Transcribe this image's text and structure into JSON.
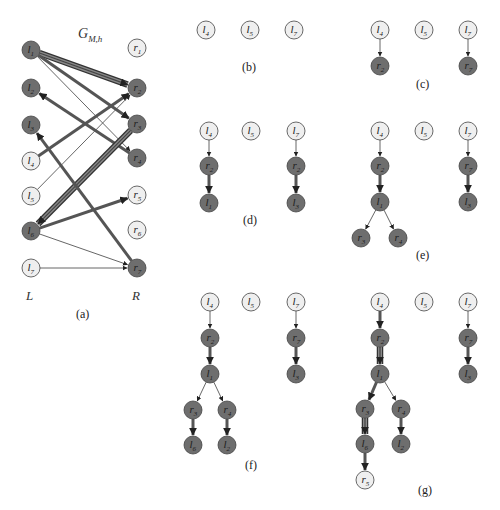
{
  "colors": {
    "matched_fill": "#6e6e6e",
    "free_fill": "#efefef",
    "stroke": "#444444",
    "edge": "#555555",
    "text_dark": "#222222"
  },
  "panel_a": {
    "title": "G",
    "title_sub": "M,h",
    "side_left": "L",
    "side_right": "R",
    "caption": "(a)",
    "left_nodes": [
      {
        "id": "l1",
        "name": "l",
        "sub": "1",
        "x": 31,
        "y": 50,
        "matched": true
      },
      {
        "id": "l2",
        "name": "l",
        "sub": "2",
        "x": 31,
        "y": 88,
        "matched": true
      },
      {
        "id": "l3",
        "name": "l",
        "sub": "3",
        "x": 31,
        "y": 125,
        "matched": true
      },
      {
        "id": "l4",
        "name": "l",
        "sub": "4",
        "x": 31,
        "y": 161,
        "matched": false
      },
      {
        "id": "l5",
        "name": "l",
        "sub": "5",
        "x": 31,
        "y": 196,
        "matched": false
      },
      {
        "id": "l6",
        "name": "l",
        "sub": "6",
        "x": 31,
        "y": 231,
        "matched": true
      },
      {
        "id": "l7",
        "name": "l",
        "sub": "7",
        "x": 31,
        "y": 268,
        "matched": false
      }
    ],
    "right_nodes": [
      {
        "id": "r1",
        "name": "r",
        "sub": "1",
        "x": 137,
        "y": 48,
        "matched": false
      },
      {
        "id": "r2",
        "name": "r",
        "sub": "2",
        "x": 137,
        "y": 88,
        "matched": true
      },
      {
        "id": "r3",
        "name": "r",
        "sub": "3",
        "x": 137,
        "y": 124,
        "matched": true
      },
      {
        "id": "r4",
        "name": "r",
        "sub": "4",
        "x": 137,
        "y": 158,
        "matched": true
      },
      {
        "id": "r5",
        "name": "r",
        "sub": "5",
        "x": 137,
        "y": 195,
        "matched": false
      },
      {
        "id": "r6",
        "name": "r",
        "sub": "6",
        "x": 137,
        "y": 230,
        "matched": false
      },
      {
        "id": "r7",
        "name": "r",
        "sub": "7",
        "x": 137,
        "y": 268,
        "matched": true
      }
    ],
    "edges": [
      {
        "from": "l1",
        "to": "r2",
        "weight": "thick"
      },
      {
        "from": "l1",
        "to": "r3",
        "weight": "medium"
      },
      {
        "from": "l1",
        "to": "r4",
        "weight": "thin"
      },
      {
        "from": "r4",
        "to": "l2",
        "weight": "medium"
      },
      {
        "from": "l4",
        "to": "r2",
        "weight": "medium"
      },
      {
        "from": "l5",
        "to": "r2",
        "weight": "thin"
      },
      {
        "from": "r3",
        "to": "l6",
        "weight": "thick"
      },
      {
        "from": "r7",
        "to": "l3",
        "weight": "medium"
      },
      {
        "from": "l6",
        "to": "r5",
        "weight": "medium"
      },
      {
        "from": "l6",
        "to": "r7",
        "weight": "thin"
      },
      {
        "from": "l7",
        "to": "r7",
        "weight": "thin"
      }
    ]
  },
  "panels": [
    {
      "id": "b",
      "caption": "(b)",
      "caption_x": 250,
      "caption_y": 71,
      "nodes": [
        {
          "id": "l4",
          "name": "l",
          "sub": "4",
          "x": 206,
          "y": 30,
          "matched": false
        },
        {
          "id": "l5",
          "name": "l",
          "sub": "5",
          "x": 250,
          "y": 30,
          "matched": false
        },
        {
          "id": "l7",
          "name": "l",
          "sub": "7",
          "x": 294,
          "y": 30,
          "matched": false
        }
      ],
      "edges": []
    },
    {
      "id": "c",
      "caption": "(c)",
      "caption_x": 424,
      "caption_y": 88,
      "nodes": [
        {
          "id": "l4",
          "name": "l",
          "sub": "4",
          "x": 380,
          "y": 30,
          "matched": false
        },
        {
          "id": "l5",
          "name": "l",
          "sub": "5",
          "x": 424,
          "y": 30,
          "matched": false
        },
        {
          "id": "l7",
          "name": "l",
          "sub": "7",
          "x": 468,
          "y": 30,
          "matched": false
        },
        {
          "id": "r2",
          "name": "r",
          "sub": "2",
          "x": 380,
          "y": 66,
          "matched": true
        },
        {
          "id": "r7",
          "name": "r",
          "sub": "7",
          "x": 468,
          "y": 66,
          "matched": true
        }
      ],
      "edges": [
        {
          "from": "l4",
          "to": "r2",
          "weight": "thin"
        },
        {
          "from": "l7",
          "to": "r7",
          "weight": "thin"
        }
      ]
    },
    {
      "id": "d",
      "caption": "(d)",
      "caption_x": 251,
      "caption_y": 224,
      "nodes": [
        {
          "id": "l4",
          "name": "l",
          "sub": "4",
          "x": 209,
          "y": 131,
          "matched": false
        },
        {
          "id": "l5",
          "name": "l",
          "sub": "5",
          "x": 251,
          "y": 131,
          "matched": false
        },
        {
          "id": "l7",
          "name": "l",
          "sub": "7",
          "x": 296,
          "y": 131,
          "matched": false
        },
        {
          "id": "r2",
          "name": "r",
          "sub": "2",
          "x": 209,
          "y": 166,
          "matched": true
        },
        {
          "id": "r2b",
          "name": "r",
          "sub": "2",
          "x": 296,
          "y": 166,
          "matched": true
        },
        {
          "id": "l1",
          "name": "l",
          "sub": "1",
          "x": 209,
          "y": 203,
          "matched": true
        },
        {
          "id": "l3",
          "name": "l",
          "sub": "3",
          "x": 296,
          "y": 203,
          "matched": true
        }
      ],
      "edges": [
        {
          "from": "l4",
          "to": "r2",
          "weight": "thin"
        },
        {
          "from": "r2",
          "to": "l1",
          "weight": "medium"
        },
        {
          "from": "l7",
          "to": "r2b",
          "weight": "thin"
        },
        {
          "from": "r2b",
          "to": "l3",
          "weight": "medium"
        }
      ]
    },
    {
      "id": "e",
      "caption": "(e)",
      "caption_x": 424,
      "caption_y": 259,
      "nodes": [
        {
          "id": "l4",
          "name": "l",
          "sub": "4",
          "x": 380,
          "y": 131,
          "matched": false
        },
        {
          "id": "l5",
          "name": "l",
          "sub": "5",
          "x": 424,
          "y": 131,
          "matched": false
        },
        {
          "id": "l7",
          "name": "l",
          "sub": "7",
          "x": 468,
          "y": 131,
          "matched": false
        },
        {
          "id": "r2",
          "name": "r",
          "sub": "2",
          "x": 380,
          "y": 166,
          "matched": true
        },
        {
          "id": "r7",
          "name": "r",
          "sub": "7",
          "x": 468,
          "y": 166,
          "matched": true
        },
        {
          "id": "l1",
          "name": "l",
          "sub": "1",
          "x": 380,
          "y": 202,
          "matched": true
        },
        {
          "id": "l3",
          "name": "l",
          "sub": "3",
          "x": 468,
          "y": 202,
          "matched": true
        },
        {
          "id": "r3",
          "name": "r",
          "sub": "3",
          "x": 361,
          "y": 238,
          "matched": true
        },
        {
          "id": "r4",
          "name": "r",
          "sub": "4",
          "x": 398,
          "y": 238,
          "matched": true
        }
      ],
      "edges": [
        {
          "from": "l4",
          "to": "r2",
          "weight": "thin"
        },
        {
          "from": "r2",
          "to": "l1",
          "weight": "medium"
        },
        {
          "from": "l1",
          "to": "r3",
          "weight": "thin"
        },
        {
          "from": "l1",
          "to": "r4",
          "weight": "thin"
        },
        {
          "from": "l7",
          "to": "r7",
          "weight": "thin"
        },
        {
          "from": "r7",
          "to": "l3",
          "weight": "medium"
        }
      ]
    },
    {
      "id": "f",
      "caption": "(f)",
      "caption_x": 253,
      "caption_y": 469,
      "nodes": [
        {
          "id": "l4",
          "name": "l",
          "sub": "4",
          "x": 210,
          "y": 302,
          "matched": false
        },
        {
          "id": "l5",
          "name": "l",
          "sub": "5",
          "x": 251,
          "y": 302,
          "matched": false
        },
        {
          "id": "l7",
          "name": "l",
          "sub": "7",
          "x": 296,
          "y": 302,
          "matched": false
        },
        {
          "id": "r2",
          "name": "r",
          "sub": "2",
          "x": 210,
          "y": 338,
          "matched": true
        },
        {
          "id": "r7",
          "name": "r",
          "sub": "7",
          "x": 296,
          "y": 338,
          "matched": true
        },
        {
          "id": "l1",
          "name": "l",
          "sub": "1",
          "x": 210,
          "y": 374,
          "matched": true
        },
        {
          "id": "l3",
          "name": "l",
          "sub": "3",
          "x": 296,
          "y": 374,
          "matched": true
        },
        {
          "id": "r3",
          "name": "r",
          "sub": "3",
          "x": 193,
          "y": 410,
          "matched": true
        },
        {
          "id": "r4",
          "name": "r",
          "sub": "4",
          "x": 227,
          "y": 410,
          "matched": true
        },
        {
          "id": "l6",
          "name": "l",
          "sub": "6",
          "x": 193,
          "y": 445,
          "matched": true
        },
        {
          "id": "l2",
          "name": "l",
          "sub": "2",
          "x": 227,
          "y": 445,
          "matched": true
        }
      ],
      "edges": [
        {
          "from": "l4",
          "to": "r2",
          "weight": "thin"
        },
        {
          "from": "r2",
          "to": "l1",
          "weight": "medium"
        },
        {
          "from": "l1",
          "to": "r3",
          "weight": "thin"
        },
        {
          "from": "l1",
          "to": "r4",
          "weight": "thin"
        },
        {
          "from": "r3",
          "to": "l6",
          "weight": "medium"
        },
        {
          "from": "r4",
          "to": "l2",
          "weight": "medium"
        },
        {
          "from": "l7",
          "to": "r7",
          "weight": "thin"
        },
        {
          "from": "r7",
          "to": "l3",
          "weight": "medium"
        }
      ]
    },
    {
      "id": "g",
      "caption": "(g)",
      "caption_x": 426,
      "caption_y": 494,
      "nodes": [
        {
          "id": "l4",
          "name": "l",
          "sub": "4",
          "x": 380,
          "y": 302,
          "matched": false
        },
        {
          "id": "l5",
          "name": "l",
          "sub": "5",
          "x": 424,
          "y": 302,
          "matched": false
        },
        {
          "id": "l7",
          "name": "l",
          "sub": "7",
          "x": 468,
          "y": 302,
          "matched": false
        },
        {
          "id": "r2",
          "name": "r",
          "sub": "2",
          "x": 380,
          "y": 338,
          "matched": true
        },
        {
          "id": "r7",
          "name": "r",
          "sub": "7",
          "x": 468,
          "y": 338,
          "matched": true
        },
        {
          "id": "l1",
          "name": "l",
          "sub": "1",
          "x": 380,
          "y": 374,
          "matched": true
        },
        {
          "id": "l3",
          "name": "l",
          "sub": "3",
          "x": 468,
          "y": 374,
          "matched": true
        },
        {
          "id": "r3",
          "name": "r",
          "sub": "3",
          "x": 365,
          "y": 409,
          "matched": true
        },
        {
          "id": "r4",
          "name": "r",
          "sub": "4",
          "x": 401,
          "y": 409,
          "matched": true
        },
        {
          "id": "l6",
          "name": "l",
          "sub": "6",
          "x": 365,
          "y": 444,
          "matched": true
        },
        {
          "id": "l2",
          "name": "l",
          "sub": "2",
          "x": 401,
          "y": 444,
          "matched": true
        },
        {
          "id": "r5",
          "name": "r",
          "sub": "5",
          "x": 365,
          "y": 480,
          "matched": false
        }
      ],
      "edges": [
        {
          "from": "l4",
          "to": "r2",
          "weight": "medium"
        },
        {
          "from": "r2",
          "to": "l1",
          "weight": "thick"
        },
        {
          "from": "l1",
          "to": "r3",
          "weight": "medium"
        },
        {
          "from": "l1",
          "to": "r4",
          "weight": "thin"
        },
        {
          "from": "r3",
          "to": "l6",
          "weight": "thick"
        },
        {
          "from": "r4",
          "to": "l2",
          "weight": "medium"
        },
        {
          "from": "l6",
          "to": "r5",
          "weight": "medium"
        },
        {
          "from": "l7",
          "to": "r7",
          "weight": "thin"
        },
        {
          "from": "r7",
          "to": "l3",
          "weight": "medium"
        }
      ]
    }
  ]
}
